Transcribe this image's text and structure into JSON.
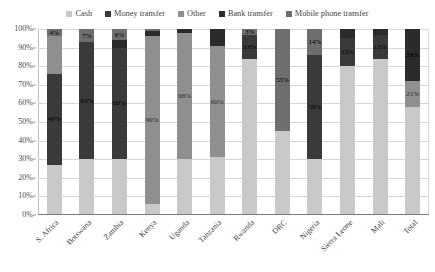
{
  "chart_data": {
    "type": "bar",
    "subtype": "100% stacked column",
    "title": "",
    "xlabel": "",
    "ylabel": "",
    "ylim": [
      0,
      100
    ],
    "ytick_labels": [
      "100%",
      "90%",
      "80%",
      "70%",
      "60%",
      "50%",
      "40%",
      "30%",
      "20%",
      "10%",
      "0%"
    ],
    "ytick_values": [
      100,
      90,
      80,
      70,
      60,
      50,
      40,
      30,
      20,
      10,
      0
    ],
    "grid": true,
    "legend_position": "top",
    "categories": [
      "S. Africa",
      "Botswana",
      "Zambia",
      "Kenya",
      "Uganda",
      "Tanzania",
      "Rwanda",
      "DRC",
      "Nigeria",
      "Sierra Leone",
      "Mali",
      "Total"
    ],
    "series": [
      {
        "name": "Cash",
        "color": "#c9c9c9",
        "values": [
          27,
          30,
          30,
          6,
          30,
          31,
          84,
          45,
          30,
          80,
          84,
          58
        ]
      },
      {
        "name": "Money transfer",
        "color": "#3a3a3a",
        "values": [
          49,
          63,
          60,
          0,
          0,
          0,
          13,
          0,
          56,
          15,
          13,
          0
        ]
      },
      {
        "name": "Other",
        "color": "#8f8f8f",
        "values": [
          20,
          0,
          0,
          90,
          68,
          60,
          0,
          0,
          0,
          0,
          0,
          14
        ]
      },
      {
        "name": "Bank transfer",
        "color": "#2b2b2b",
        "values": [
          0,
          0,
          4,
          3,
          2,
          9,
          0,
          0,
          0,
          5,
          3,
          28
        ]
      },
      {
        "name": "Mobile phone transfer",
        "color": "#6e6e6e",
        "values": [
          4,
          7,
          6,
          1,
          0,
          0,
          3,
          55,
          14,
          0,
          0,
          0
        ]
      }
    ],
    "data_labels": [
      {
        "category": "S. Africa",
        "series": "Mobile phone transfer",
        "text": "4%"
      },
      {
        "category": "S. Africa",
        "series": "Money transfer",
        "text": "49%"
      },
      {
        "category": "Botswana",
        "series": "Mobile phone transfer",
        "text": "7%"
      },
      {
        "category": "Botswana",
        "series": "Money transfer",
        "text": "63%"
      },
      {
        "category": "Zambia",
        "series": "Mobile phone transfer",
        "text": "6%"
      },
      {
        "category": "Zambia",
        "series": "Money transfer",
        "text": "60%"
      },
      {
        "category": "Kenya",
        "series": "Other",
        "text": "90%"
      },
      {
        "category": "Uganda",
        "series": "Other",
        "text": "68%"
      },
      {
        "category": "Tanzania",
        "series": "Other",
        "text": "60%"
      },
      {
        "category": "Rwanda",
        "series": "Mobile phone transfer",
        "text": "3%"
      },
      {
        "category": "Rwanda",
        "series": "Money transfer",
        "text": "13%"
      },
      {
        "category": "DRC",
        "series": "Mobile phone transfer",
        "text": "55%"
      },
      {
        "category": "Nigeria",
        "series": "Mobile phone transfer",
        "text": "14%"
      },
      {
        "category": "Nigeria",
        "series": "Money transfer",
        "text": "56%"
      },
      {
        "category": "Sierra Leone",
        "series": "Money transfer",
        "text": "15%"
      },
      {
        "category": "Mali",
        "series": "Money transfer",
        "text": "13%"
      },
      {
        "category": "Total",
        "series": "Other",
        "text": "21%"
      },
      {
        "category": "Total",
        "series": "Bank transfer",
        "text": "28%"
      }
    ]
  },
  "legend": {
    "items": [
      {
        "label": "Cash"
      },
      {
        "label": "Money transfer"
      },
      {
        "label": "Other"
      },
      {
        "label": "Bank transfer"
      },
      {
        "label": "Mobile phone transfer"
      }
    ]
  }
}
